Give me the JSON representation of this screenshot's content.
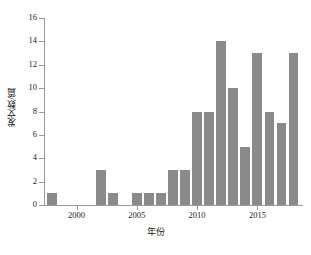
{
  "chart_data": {
    "type": "bar",
    "title": "",
    "subtitle": "",
    "xlabel": "年份",
    "ylabel": "发文数/篇",
    "categories": [
      1998,
      1999,
      2000,
      2001,
      2002,
      2003,
      2004,
      2005,
      2006,
      2007,
      2008,
      2009,
      2010,
      2011,
      2012,
      2013,
      2014,
      2015,
      2016,
      2017,
      2018
    ],
    "values": [
      1,
      0,
      0,
      0,
      3,
      1,
      0,
      1,
      1,
      1,
      3,
      3,
      8,
      8,
      14,
      10,
      5,
      13,
      8,
      7,
      13
    ],
    "xlim": [
      1997.3,
      2018.7
    ],
    "ylim": [
      0,
      16
    ],
    "y_ticks": [
      0,
      2,
      4,
      6,
      8,
      10,
      12,
      14,
      16
    ],
    "y_tick_labels": [
      "0",
      "2",
      "4",
      "6",
      "8",
      "10",
      "12",
      "14",
      "16"
    ],
    "x_ticks": [
      2000,
      2005,
      2010,
      2015
    ],
    "x_tick_labels": [
      "2000",
      "2005",
      "2010",
      "2015"
    ],
    "grid": false,
    "legend": null,
    "bar_color": "#8a8a8a",
    "axis_color": "#9a9a9a",
    "background_color": "#ffffff"
  }
}
